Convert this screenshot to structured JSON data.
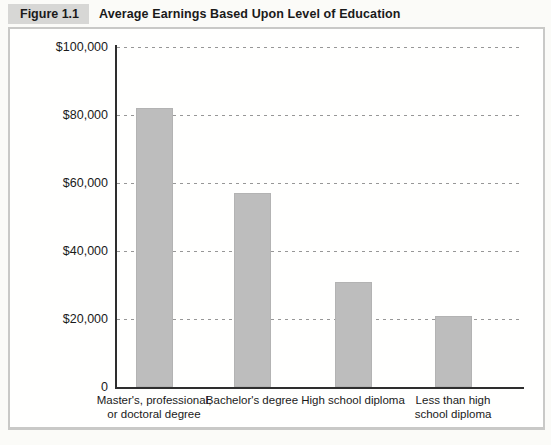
{
  "figure": {
    "label": "Figure 1.1",
    "title": "Average Earnings Based Upon Level of Education"
  },
  "chart_data": {
    "type": "bar",
    "title": "Average Earnings Based Upon Level of Education",
    "categories": [
      "Master's, professional,\nor doctoral degree",
      "Bachelor's degree",
      "High school diploma",
      "Less than high\nschool diploma"
    ],
    "values": [
      82000,
      57000,
      31000,
      21000
    ],
    "xlabel": "",
    "ylabel": "",
    "ylim": [
      0,
      100000
    ],
    "yticks": [
      {
        "value": 100000,
        "label": "$100,000"
      },
      {
        "value": 80000,
        "label": "$80,000"
      },
      {
        "value": 60000,
        "label": "$60,000"
      },
      {
        "value": 40000,
        "label": "$40,000"
      },
      {
        "value": 20000,
        "label": "$20,000"
      },
      {
        "value": 0,
        "label": "0"
      }
    ],
    "grid": "horizontal-dashed",
    "legend": "none",
    "bar_color": "#bdbdbd"
  },
  "colors": {
    "bar": "#bdbdbd",
    "gridline": "#979797",
    "axis": "#2e2e2e",
    "figure_chip_bg": "#d7d7d5",
    "frame_border": "#c9c9c7"
  }
}
